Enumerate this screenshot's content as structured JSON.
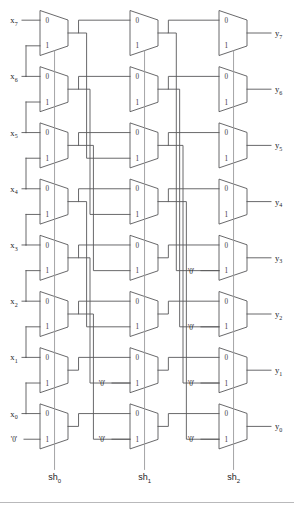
{
  "figure": {
    "type": "schematic-diagram",
    "width": 294,
    "height": 508,
    "background_color": "#ffffff",
    "line_color": "#58585a",
    "select_line_color": "#9a9a9c"
  },
  "mux": {
    "input_label_0": "0",
    "input_label_1": "1",
    "count_per_stage": 8,
    "stage_count": 3,
    "total": 24
  },
  "constants": {
    "zero_label": "'0'"
  },
  "inputs": [
    {
      "name": "x-input-7",
      "label": "x",
      "sub": "7"
    },
    {
      "name": "x-input-6",
      "label": "x",
      "sub": "6"
    },
    {
      "name": "x-input-5",
      "label": "x",
      "sub": "5"
    },
    {
      "name": "x-input-4",
      "label": "x",
      "sub": "4"
    },
    {
      "name": "x-input-3",
      "label": "x",
      "sub": "3"
    },
    {
      "name": "x-input-2",
      "label": "x",
      "sub": "2"
    },
    {
      "name": "x-input-1",
      "label": "x",
      "sub": "1"
    },
    {
      "name": "x-input-0",
      "label": "x",
      "sub": "0"
    }
  ],
  "input_zero": {
    "label": "'0'"
  },
  "outputs": [
    {
      "name": "y-output-7",
      "label": "y",
      "sub": "7"
    },
    {
      "name": "y-output-6",
      "label": "y",
      "sub": "6"
    },
    {
      "name": "y-output-5",
      "label": "y",
      "sub": "5"
    },
    {
      "name": "y-output-4",
      "label": "y",
      "sub": "4"
    },
    {
      "name": "y-output-3",
      "label": "y",
      "sub": "3"
    },
    {
      "name": "y-output-2",
      "label": "y",
      "sub": "2"
    },
    {
      "name": "y-output-1",
      "label": "y",
      "sub": "1"
    },
    {
      "name": "y-output-0",
      "label": "y",
      "sub": "0"
    }
  ],
  "selects": [
    {
      "name": "select-sh0",
      "label": "sh",
      "sub": "0",
      "stage": 0,
      "shift_amount": 1
    },
    {
      "name": "select-sh1",
      "label": "sh",
      "sub": "1",
      "stage": 1,
      "shift_amount": 2
    },
    {
      "name": "select-sh2",
      "label": "sh",
      "sub": "2",
      "stage": 2,
      "shift_amount": 4
    }
  ],
  "stages": [
    {
      "name": "stage-sh0",
      "select": "sh0",
      "shift_amount": 1,
      "mux_rows": [
        {
          "row": 0,
          "in0": "x7",
          "in1": "x6"
        },
        {
          "row": 1,
          "in0": "x6",
          "in1": "x5"
        },
        {
          "row": 2,
          "in0": "x5",
          "in1": "x4"
        },
        {
          "row": 3,
          "in0": "x4",
          "in1": "x3"
        },
        {
          "row": 4,
          "in0": "x3",
          "in1": "x2"
        },
        {
          "row": 5,
          "in0": "x2",
          "in1": "x1"
        },
        {
          "row": 6,
          "in0": "x1",
          "in1": "x0"
        },
        {
          "row": 7,
          "in0": "x0",
          "in1": "'0'"
        }
      ]
    },
    {
      "name": "stage-sh1",
      "select": "sh1",
      "shift_amount": 2,
      "mux_rows": [
        {
          "row": 0,
          "in0": "a7",
          "in1": "a5"
        },
        {
          "row": 1,
          "in0": "a6",
          "in1": "a4"
        },
        {
          "row": 2,
          "in0": "a5",
          "in1": "a3"
        },
        {
          "row": 3,
          "in0": "a4",
          "in1": "a2"
        },
        {
          "row": 4,
          "in0": "a3",
          "in1": "a1"
        },
        {
          "row": 5,
          "in0": "a2",
          "in1": "a0"
        },
        {
          "row": 6,
          "in0": "a1",
          "in1": "'0'"
        },
        {
          "row": 7,
          "in0": "a0",
          "in1": "'0'"
        }
      ]
    },
    {
      "name": "stage-sh2",
      "select": "sh2",
      "shift_amount": 4,
      "mux_rows": [
        {
          "row": 0,
          "in0": "b7",
          "in1": "b3"
        },
        {
          "row": 1,
          "in0": "b6",
          "in1": "b2"
        },
        {
          "row": 2,
          "in0": "b5",
          "in1": "b1"
        },
        {
          "row": 3,
          "in0": "b4",
          "in1": "b0"
        },
        {
          "row": 4,
          "in0": "b3",
          "in1": "'0'"
        },
        {
          "row": 5,
          "in0": "b2",
          "in1": "'0'"
        },
        {
          "row": 6,
          "in0": "b1",
          "in1": "'0'"
        },
        {
          "row": 7,
          "in0": "b0",
          "in1": "'0'"
        }
      ]
    }
  ]
}
